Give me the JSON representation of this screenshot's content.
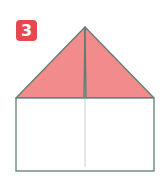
{
  "step": {
    "number": "3",
    "badge_color": "#E9474F"
  },
  "figure": {
    "fill_color": "#F28B8B",
    "stroke_color": "#5F7D75",
    "crease_color": "#C9D3D0",
    "background_color": "#FFFFFF"
  }
}
